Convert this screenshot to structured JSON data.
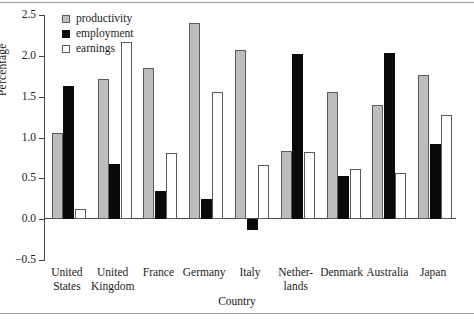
{
  "chart_data": {
    "type": "bar",
    "title": "",
    "xlabel": "Country",
    "ylabel": "Percentage",
    "ylim": [
      -0.5,
      2.5
    ],
    "ytick_labels": [
      "2.5",
      "2.0",
      "1.5",
      "1.0",
      "0.5",
      "0.0",
      "-0.5"
    ],
    "ytick_values": [
      2.5,
      2.0,
      1.5,
      1.0,
      0.5,
      0.0,
      -0.5
    ],
    "grid": false,
    "legend_position": "top-left",
    "categories": [
      "United States",
      "United Kingdom",
      "France",
      "Germany",
      "Italy",
      "Netherlands",
      "Denmark",
      "Australia",
      "Japan"
    ],
    "category_labels": [
      "United\nStates",
      "United\nKingdom",
      "France",
      "Germany",
      "Italy",
      "Nether-\nlands",
      "Denmark",
      "Australia",
      "Japan"
    ],
    "series": [
      {
        "name": "productivity",
        "color": "#bdbdbd",
        "values": [
          1.05,
          1.72,
          1.85,
          2.4,
          2.07,
          0.84,
          1.56,
          1.4,
          1.77
        ]
      },
      {
        "name": "employment",
        "color": "#0a0a0a",
        "values": [
          1.63,
          0.68,
          0.34,
          0.25,
          -0.13,
          2.02,
          0.53,
          2.04,
          0.92
        ]
      },
      {
        "name": "earnings",
        "color": "#ffffff",
        "values": [
          0.13,
          2.17,
          0.81,
          1.56,
          0.66,
          0.82,
          0.61,
          0.57,
          1.27
        ]
      }
    ]
  },
  "legend": {
    "items": [
      {
        "label": "productivity",
        "key": "productivity"
      },
      {
        "label": "employment",
        "key": "employment"
      },
      {
        "label": "earnings",
        "key": "earnings"
      }
    ]
  }
}
